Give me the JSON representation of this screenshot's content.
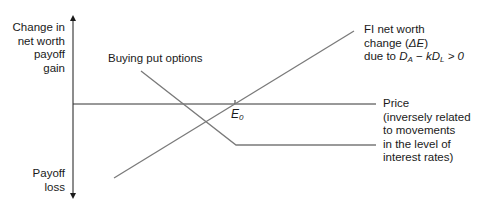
{
  "y_axis": {
    "top_label": [
      "Change in",
      "net worth",
      "payoff",
      "gain"
    ],
    "bottom_label": [
      "Payoff",
      "loss"
    ]
  },
  "x_axis": {
    "label": [
      "Price",
      "(inversely related",
      "to movements",
      "in the level of",
      "interest rates)"
    ]
  },
  "lines": {
    "put": {
      "label": "Buying put options"
    },
    "net_worth": {
      "label_line1": "FI net worth",
      "label_line2_prefix": "change (",
      "label_line2_symbol": "ΔE",
      "label_line2_suffix": ")",
      "label_line3_prefix": "due to ",
      "term_a": "D",
      "term_a_sub": "A",
      "minus": " − ",
      "term_k": "kD",
      "term_k_sub": "L",
      "condition": " > 0"
    }
  },
  "point": {
    "label": "E",
    "sub": "0"
  },
  "colors": {
    "axis": "#1a1a1a",
    "line": "#7a7a7a"
  }
}
